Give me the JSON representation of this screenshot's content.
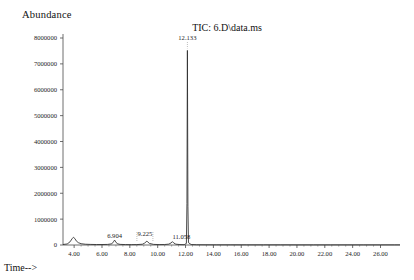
{
  "chart_data": {
    "type": "line",
    "title": "TIC: 6.D\\data.ms",
    "ylabel": "Abundance",
    "xlabel": "Time-->",
    "xlim": [
      3.2,
      27.4
    ],
    "ylim": [
      0,
      8000000
    ],
    "grid": false,
    "legend": "none",
    "y_ticks": [
      "0",
      "1000000",
      "2000000",
      "3000000",
      "4000000",
      "5000000",
      "6000000",
      "7000000",
      "8000000"
    ],
    "y_tick_values": [
      0,
      1000000,
      2000000,
      3000000,
      4000000,
      5000000,
      6000000,
      7000000,
      8000000
    ],
    "x_ticks": [
      "4.00",
      "6.00",
      "8.00",
      "10.00",
      "12.00",
      "14.00",
      "16.00",
      "18.00",
      "20.00",
      "22.00",
      "24.00",
      "26.00"
    ],
    "x_tick_values": [
      4,
      6,
      8,
      10,
      12,
      14,
      16,
      18,
      20,
      22,
      24,
      26
    ],
    "peaks": [
      {
        "label": "6.904",
        "rt": 6.904,
        "height": 190000
      },
      {
        "label": "9.225",
        "rt": 9.225,
        "height": 150000
      },
      {
        "label": "11.058",
        "rt": 11.058,
        "height": 130000
      },
      {
        "label": "12.133",
        "rt": 12.133,
        "height": 7520000
      }
    ],
    "series": [
      {
        "name": "TIC",
        "x": [
          3.2,
          3.5,
          3.7,
          3.85,
          3.95,
          4.05,
          4.15,
          4.3,
          4.5,
          4.8,
          5.2,
          5.6,
          6.0,
          6.4,
          6.7,
          6.82,
          6.904,
          6.99,
          7.1,
          7.3,
          7.7,
          8.1,
          8.5,
          8.9,
          9.05,
          9.16,
          9.225,
          9.29,
          9.4,
          9.7,
          10.1,
          10.5,
          10.8,
          10.96,
          11.058,
          11.15,
          11.3,
          11.6,
          11.9,
          12.06,
          12.1,
          12.133,
          12.17,
          12.21,
          12.4,
          12.8,
          13.4,
          14.2,
          15.2,
          16.4,
          17.6,
          18.8,
          20.0,
          21.2,
          22.4,
          23.6,
          24.8,
          26.0,
          27.0,
          27.4
        ],
        "y": [
          20000,
          40000,
          120000,
          240000,
          300000,
          250000,
          160000,
          90000,
          50000,
          30000,
          22000,
          18000,
          18000,
          22000,
          45000,
          120000,
          190000,
          120000,
          48000,
          24000,
          16000,
          14000,
          16000,
          30000,
          70000,
          120000,
          150000,
          118000,
          62000,
          24000,
          16000,
          18000,
          34000,
          80000,
          130000,
          78000,
          32000,
          16000,
          12000,
          60000,
          1600000,
          7520000,
          1500000,
          90000,
          18000,
          10000,
          8000,
          7000,
          7000,
          6000,
          6000,
          6000,
          5000,
          5000,
          5000,
          5000,
          5000,
          5000,
          5000,
          5000
        ]
      }
    ]
  }
}
